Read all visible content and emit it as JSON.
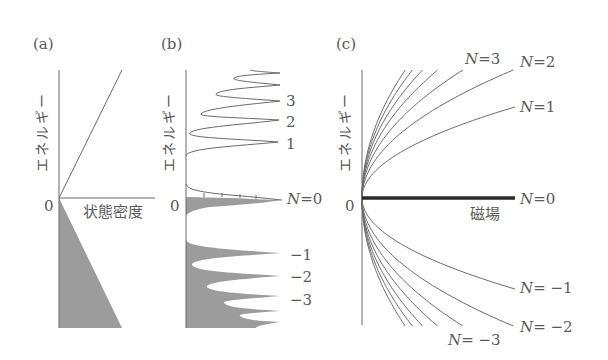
{
  "panels": {
    "a": {
      "tag": "(a)",
      "ylabel": "エネルギー",
      "zero": "0",
      "xlabel": "状態密度"
    },
    "b": {
      "tag": "(b)",
      "ylabel": "エネルギー",
      "zero": "0",
      "labels": {
        "n3": "3",
        "n2": "2",
        "n1": "1",
        "n0_var": "N",
        "n0_eq": "=0",
        "nm1": "−1",
        "nm2": "−2",
        "nm3": "−3"
      }
    },
    "c": {
      "tag": "(c)",
      "ylabel": "エネルギー",
      "zero": "0",
      "xlabel": "磁場",
      "labels": {
        "n3_var": "N",
        "n3_eq": "=3",
        "n2_var": "N",
        "n2_eq": "=2",
        "n1_var": "N",
        "n1_eq": "=1",
        "n0_var": "N",
        "n0_eq": "=0",
        "nm1_var": "N",
        "nm1_eq": "= −1",
        "nm2_var": "N",
        "nm2_eq": "= −2",
        "nm3_var": "N",
        "nm3_eq": "= −3"
      }
    }
  },
  "chart_data": [
    {
      "type": "area",
      "title": "(a) Density of states without magnetic field (graphene, linear dispersion)",
      "xlabel": "状態密度",
      "ylabel": "エネルギー",
      "description": "DOS proportional to |E|; positive energies shown as line, negative energies filled (occupied)",
      "points_E_vs_DOS": [
        [
          0,
          0
        ],
        [
          1,
          1
        ]
      ],
      "filled_region": "E < 0"
    },
    {
      "type": "line",
      "title": "(b) Density of states in magnetic field (Landau levels)",
      "ylabel": "エネルギー",
      "peaks_N": [
        3,
        2,
        1,
        0,
        -1,
        -2,
        -3
      ],
      "peak_labels": [
        "3",
        "2",
        "1",
        "N=0",
        "−1",
        "−2",
        "−3"
      ],
      "peak_energy_rel": [
        0.74,
        0.6,
        0.42,
        0,
        -0.42,
        -0.6,
        -0.74
      ],
      "filled_region": "E <= 0 (half of N=0 filled)"
    },
    {
      "type": "line",
      "title": "(c) Landau level energies vs magnetic field",
      "xlabel": "磁場",
      "ylabel": "エネルギー",
      "formula": "E_N ∝ sign(N)·sqrt(|N|·B)",
      "series": [
        {
          "name": "N=7",
          "n": 7
        },
        {
          "name": "N=6",
          "n": 6
        },
        {
          "name": "N=5",
          "n": 5
        },
        {
          "name": "N=4",
          "n": 4
        },
        {
          "name": "N=3",
          "n": 3
        },
        {
          "name": "N=2",
          "n": 2
        },
        {
          "name": "N=1",
          "n": 1
        },
        {
          "name": "N=0",
          "n": 0
        },
        {
          "name": "N=-1",
          "n": -1
        },
        {
          "name": "N=-2",
          "n": -2
        },
        {
          "name": "N=-3",
          "n": -3
        },
        {
          "name": "N=-4",
          "n": -4
        },
        {
          "name": "N=-5",
          "n": -5
        },
        {
          "name": "N=-6",
          "n": -6
        },
        {
          "name": "N=-7",
          "n": -7
        }
      ]
    }
  ]
}
